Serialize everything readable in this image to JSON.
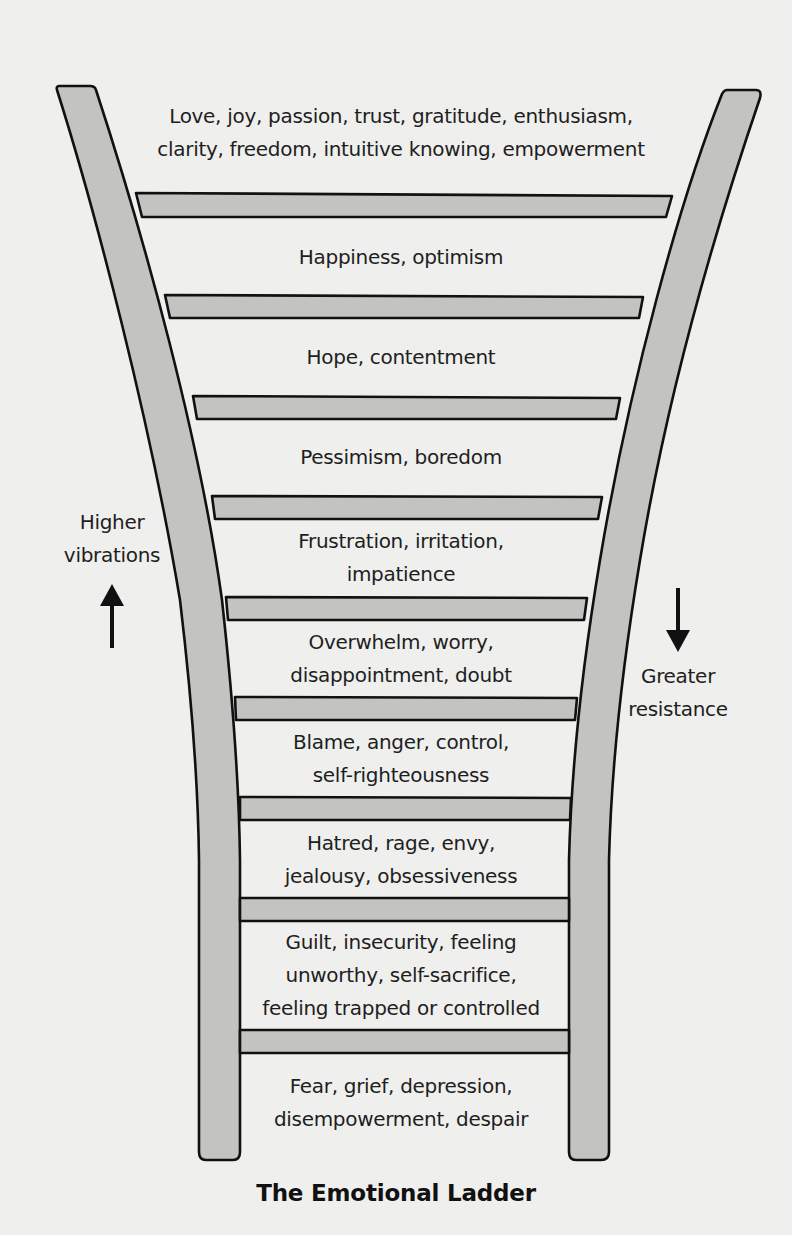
{
  "diagram": {
    "title": "The Emotional Ladder",
    "colors": {
      "background": "#efefed",
      "wood_fill": "#c3c3c1",
      "outline": "#111111",
      "text": "#1e1e1e"
    },
    "left_annotation": {
      "lines": [
        "Higher",
        "vibrations"
      ],
      "arrow": "up-arrow"
    },
    "right_annotation": {
      "lines": [
        "Greater",
        "resistance"
      ],
      "arrow": "down-arrow"
    },
    "steps": [
      {
        "level": 1,
        "lines": [
          "Love, joy, passion, trust, gratitude, enthusiasm,",
          "clarity, freedom, intuitive knowing, empowerment"
        ]
      },
      {
        "level": 2,
        "lines": [
          "Happiness, optimism"
        ]
      },
      {
        "level": 3,
        "lines": [
          "Hope, contentment"
        ]
      },
      {
        "level": 4,
        "lines": [
          "Pessimism, boredom"
        ]
      },
      {
        "level": 5,
        "lines": [
          "Frustration, irritation,",
          "impatience"
        ]
      },
      {
        "level": 6,
        "lines": [
          "Overwhelm, worry,",
          "disappointment, doubt"
        ]
      },
      {
        "level": 7,
        "lines": [
          "Blame, anger, control,",
          "self-righteousness"
        ]
      },
      {
        "level": 8,
        "lines": [
          "Hatred, rage, envy,",
          "jealousy, obsessiveness"
        ]
      },
      {
        "level": 9,
        "lines": [
          "Guilt, insecurity, feeling",
          "unworthy, self-sacrifice,",
          "feeling trapped or controlled"
        ]
      },
      {
        "level": 10,
        "lines": [
          "Fear, grief, depression,",
          "disempowerment, despair"
        ]
      }
    ]
  }
}
